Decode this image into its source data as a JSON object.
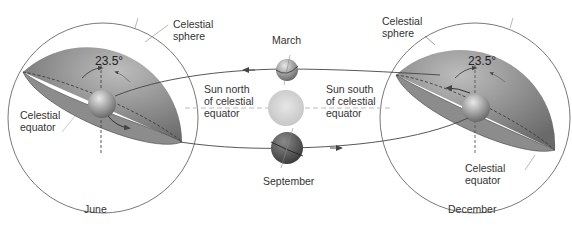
{
  "diagram": {
    "colors": {
      "sphere_fill": "#7d7d7d",
      "sphere_highlight": "#b8b8b8",
      "equator_plane": "#8e8e8e",
      "line": "#444444",
      "dashed_axis": "#555555",
      "sun": "#d8d8d8",
      "earth_march": "#9a9a9a",
      "earth_september": "#5a5a5a",
      "background": "#ffffff"
    },
    "left_sphere": {
      "month": "June",
      "sphere_label": [
        "Celestial",
        "sphere"
      ],
      "equator_label": [
        "Celestial",
        "equator"
      ],
      "angle": "23.5°"
    },
    "right_sphere": {
      "month": "December",
      "sphere_label": [
        "Celestial",
        "sphere"
      ],
      "equator_label": [
        "Celestial",
        "equator"
      ],
      "angle": "23.5°"
    },
    "center": {
      "top_month": "March",
      "bottom_month": "September",
      "north_label": [
        "Sun north",
        "of celestial",
        "equator"
      ],
      "south_label": [
        "Sun south",
        "of celestial",
        "equator"
      ]
    }
  }
}
